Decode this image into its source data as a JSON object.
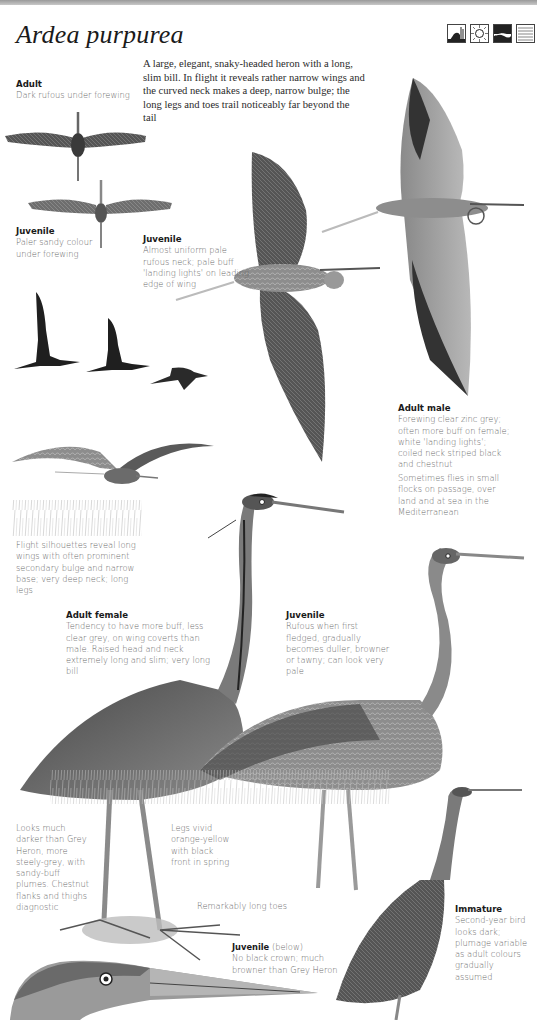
{
  "page": {
    "species_title": "Ardea purpurea",
    "habitat_icons": [
      "reedbed-marsh-icon",
      "sun-climate-icon",
      "wetland-shore-icon",
      "water-lake-icon"
    ],
    "intro_text": "A large, elegant, snaky-headed heron with a long, slim bill. In flight it reveals rather narrow wings and the curved neck makes a deep, narrow bulge; the long legs and toes trail noticeably far beyond the tail"
  },
  "captions": {
    "adult_flight": {
      "heading": "Adult",
      "text": "Dark rufous under forewing"
    },
    "juvenile_underwing": {
      "heading": "Juvenile",
      "text": "Paler sandy colour under forewing"
    },
    "juvenile_flight": {
      "heading": "Juvenile",
      "text": "Almost uniform pale rufous neck; pale buff 'landing lights' on leading edge of wing"
    },
    "adult_male": {
      "heading": "Adult male",
      "text": "Forewing clear zinc grey; often more buff on female; white 'landing lights'; coiled neck striped black and chestnut"
    },
    "flocks": {
      "text": "Sometimes flies in small flocks on passage, over land and at sea in the Mediterranean"
    },
    "silhouettes": {
      "text": "Flight silhouettes reveal long wings with often prominent secondary bulge and narrow base; very deep neck; long legs"
    },
    "adult_female": {
      "heading": "Adult female",
      "text": "Tendency to have more buff, less clear grey, on wing coverts than male. Raised head and neck extremely long and slim; very long bill"
    },
    "juvenile_standing": {
      "heading": "Juvenile",
      "text": "Rufous when first fledged, gradually becomes duller, browner or tawny; can look very pale"
    },
    "darker": {
      "text": "Looks much darker than Grey Heron, more steely-grey, with sandy-buff plumes. Chestnut flanks and thighs diagnostic"
    },
    "legs": {
      "text": "Legs vivid orange-yellow with black front in spring"
    },
    "toes": {
      "text": "Remarkably long toes"
    },
    "juvenile_head": {
      "heading": "Juvenile",
      "suffix": " (below)",
      "text": "No black crown; much browner than Grey Heron"
    },
    "immature": {
      "heading": "Immature",
      "text": "Second-year bird looks dark; plumage variable as adult colours gradually assumed"
    }
  },
  "illustrations": [
    "adult-underwing-flight",
    "juvenile-underwing-flight",
    "silhouette-1",
    "silhouette-2",
    "silhouette-3",
    "gliding-heron",
    "juvenile-upperwing-flight",
    "adult-male-upperwing-flight",
    "adult-female-standing",
    "juvenile-standing",
    "feet-detail",
    "juvenile-head-detail",
    "immature-standing"
  ]
}
